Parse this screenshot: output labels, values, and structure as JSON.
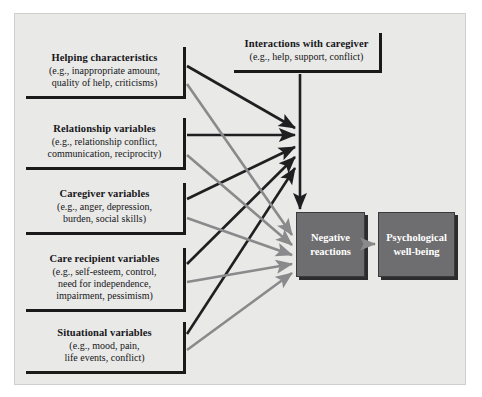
{
  "figure": {
    "background_color": "#e9e9e7",
    "page_color": "#ffffff",
    "border_color": "#cfcfcc"
  },
  "colors": {
    "black_arrow": "#1f1f22",
    "gray_arrow": "#8a8a8c",
    "box_outline": "#1a1a1a",
    "shaded_fill": "#6e6e70",
    "shaded_text": "#ffffff",
    "text": "#16161a"
  },
  "predictor_boxes": [
    {
      "title": "Helping characteristics",
      "line1": "(e.g., inappropriate amount,",
      "line2": "quality of help, criticisms)",
      "line3": ""
    },
    {
      "title": "Relationship variables",
      "line1": "(e.g., relationship conflict,",
      "line2": "communication, reciprocity)",
      "line3": ""
    },
    {
      "title": "Caregiver variables",
      "line1": "(e.g., anger, depression,",
      "line2": "burden, social skills)",
      "line3": ""
    },
    {
      "title": "Care recipient variables",
      "line1": "(e.g., self-esteem, control,",
      "line2": "need for independence,",
      "line3": "impairment, pessimism)"
    },
    {
      "title": "Situational variables",
      "line1": "(e.g., mood, pain,",
      "line2": "life events, conflict)",
      "line3": ""
    }
  ],
  "top_box": {
    "title": "Interactions with caregiver",
    "line1": "(e.g., help, support, conflict)"
  },
  "outcome_boxes": [
    {
      "line1": "Negative",
      "line2": "reactions"
    },
    {
      "line1": "Psychological",
      "line2": "well-being"
    }
  ]
}
